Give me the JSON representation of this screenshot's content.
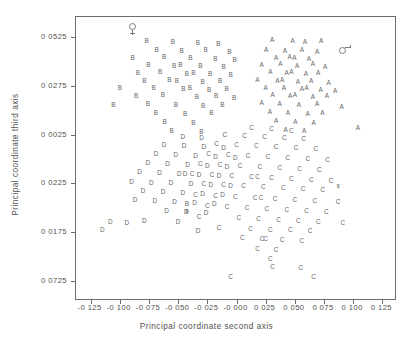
{
  "chart_data": {
    "type": "scatter",
    "title": "",
    "xlabel": "Principal coordinate second axis",
    "ylabel": "Principal coordinate third axis",
    "xlim": [
      -0.1375,
      0.1375
    ],
    "ylim": [
      -0.0825,
      0.0625
    ],
    "grid": false,
    "legend": "none",
    "xticks": [
      "-0 125",
      "-0 100",
      "-0 075",
      "-0 050",
      "-0 025",
      "-0 000",
      "0 025",
      "0 050",
      "0 075",
      "0 100",
      "0 125"
    ],
    "xtickvalues": [
      -0.125,
      -0.1,
      -0.075,
      -0.05,
      -0.025,
      -0.0,
      0.025,
      0.05,
      0.075,
      0.1,
      0.125
    ],
    "yticks": [
      "0 0525",
      "0 0275",
      "0 0025",
      "0 0225",
      "0 0175",
      "0 0725"
    ],
    "ytickvalues": [
      0.0525,
      0.0275,
      0.0025,
      -0.0225,
      -0.0475,
      -0.0725
    ],
    "marker_labels": [
      "A",
      "B",
      "C",
      "D"
    ],
    "series": [
      {
        "name": "A",
        "marker": "A",
        "points": [
          [
            0.0305,
            0.051
          ],
          [
            0.048,
            0.0505
          ],
          [
            0.0585,
            0.0495
          ],
          [
            0.0725,
            0.05
          ],
          [
            0.0255,
            0.0455
          ],
          [
            0.0415,
            0.045
          ],
          [
            0.056,
            0.0455
          ],
          [
            0.069,
            0.0445
          ],
          [
            0.034,
            0.0415
          ],
          [
            0.0455,
            0.042
          ],
          [
            0.0495,
            0.0415
          ],
          [
            0.062,
            0.041
          ],
          [
            0.0215,
            0.038
          ],
          [
            0.0375,
            0.0385
          ],
          [
            0.052,
            0.0375
          ],
          [
            0.0655,
            0.0385
          ],
          [
            0.076,
            0.037
          ],
          [
            0.029,
            0.0345
          ],
          [
            0.043,
            0.034
          ],
          [
            0.047,
            0.0345
          ],
          [
            0.0595,
            0.0335
          ],
          [
            0.07,
            0.034
          ],
          [
            0.018,
            0.0305
          ],
          [
            0.035,
            0.03
          ],
          [
            0.039,
            0.0305
          ],
          [
            0.0525,
            0.0295
          ],
          [
            0.064,
            0.03
          ],
          [
            0.079,
            0.029
          ],
          [
            0.025,
            0.0265
          ],
          [
            0.0405,
            0.026
          ],
          [
            0.056,
            0.0255
          ],
          [
            0.06,
            0.026
          ],
          [
            0.072,
            0.025
          ],
          [
            0.0845,
            0.0245
          ],
          [
            0.031,
            0.0225
          ],
          [
            0.046,
            0.022
          ],
          [
            0.05,
            0.0225
          ],
          [
            0.0655,
            0.0215
          ],
          [
            0.0775,
            0.022
          ],
          [
            0.0215,
            0.0185
          ],
          [
            0.037,
            0.018
          ],
          [
            0.0535,
            0.0175
          ],
          [
            0.069,
            0.018
          ],
          [
            0.09,
            0.0165
          ],
          [
            0.0285,
            0.014
          ],
          [
            0.044,
            0.0135
          ],
          [
            0.061,
            0.013
          ],
          [
            0.0735,
            0.0135
          ],
          [
            0.034,
            0.0095
          ],
          [
            0.0505,
            0.009
          ],
          [
            0.066,
            0.0085
          ],
          [
            0.042,
            0.005
          ],
          [
            0.058,
            0.0045
          ],
          [
            0.104,
            0.006
          ]
        ]
      },
      {
        "name": "B",
        "marker": "B",
        "points": [
          [
            -0.077,
            0.05
          ],
          [
            -0.0545,
            0.0495
          ],
          [
            -0.033,
            0.049
          ],
          [
            -0.0155,
            0.0485
          ],
          [
            -0.0685,
            0.0455
          ],
          [
            -0.047,
            0.045
          ],
          [
            -0.0265,
            0.0455
          ],
          [
            -0.006,
            0.0445
          ],
          [
            -0.089,
            0.0415
          ],
          [
            -0.062,
            0.042
          ],
          [
            -0.0395,
            0.0415
          ],
          [
            -0.018,
            0.041
          ],
          [
            -0.0015,
            0.0405
          ],
          [
            -0.0755,
            0.038
          ],
          [
            -0.0535,
            0.0375
          ],
          [
            -0.048,
            0.038
          ],
          [
            -0.031,
            0.0375
          ],
          [
            -0.011,
            0.037
          ],
          [
            -0.0845,
            0.034
          ],
          [
            -0.0655,
            0.0345
          ],
          [
            -0.0425,
            0.0335
          ],
          [
            -0.037,
            0.034
          ],
          [
            -0.0225,
            0.0335
          ],
          [
            -0.005,
            0.033
          ],
          [
            -0.079,
            0.03
          ],
          [
            -0.0575,
            0.0305
          ],
          [
            -0.051,
            0.03
          ],
          [
            -0.029,
            0.0295
          ],
          [
            -0.014,
            0.03
          ],
          [
            -0.1,
            0.0265
          ],
          [
            -0.071,
            0.026
          ],
          [
            -0.0455,
            0.0255
          ],
          [
            -0.04,
            0.026
          ],
          [
            -0.0235,
            0.025
          ],
          [
            -0.0085,
            0.0255
          ],
          [
            -0.086,
            0.022
          ],
          [
            -0.063,
            0.0225
          ],
          [
            -0.034,
            0.0215
          ],
          [
            -0.0175,
            0.022
          ],
          [
            -0.002,
            0.021
          ],
          [
            -0.1055,
            0.0175
          ],
          [
            -0.076,
            0.018
          ],
          [
            -0.052,
            0.0175
          ],
          [
            -0.0285,
            0.017
          ],
          [
            -0.012,
            0.0175
          ],
          [
            -0.069,
            0.0135
          ],
          [
            -0.044,
            0.013
          ],
          [
            -0.0215,
            0.0135
          ],
          [
            -0.0615,
            0.009
          ],
          [
            -0.037,
            0.0085
          ],
          [
            -0.0555,
            0.0045
          ],
          [
            -0.03,
            0.004
          ],
          [
            -0.0425,
            -0.033
          ]
        ]
      },
      {
        "name": "C",
        "marker": "C",
        "points": [
          [
            0.013,
            0.006
          ],
          [
            0.03,
            0.0055
          ],
          [
            0.047,
            0.0045
          ],
          [
            -0.01,
            0.002
          ],
          [
            0.007,
            0.0015
          ],
          [
            0.024,
            0.001
          ],
          [
            0.041,
            0.0005
          ],
          [
            0.0575,
            0.0
          ],
          [
            -0.017,
            -0.0025
          ],
          [
            0.0,
            -0.003
          ],
          [
            0.017,
            -0.0035
          ],
          [
            0.034,
            -0.004
          ],
          [
            0.051,
            -0.0045
          ],
          [
            0.068,
            -0.005
          ],
          [
            -0.024,
            -0.0075
          ],
          [
            -0.007,
            -0.008
          ],
          [
            0.01,
            -0.0085
          ],
          [
            0.027,
            -0.009
          ],
          [
            0.044,
            -0.0095
          ],
          [
            0.061,
            -0.01
          ],
          [
            0.078,
            -0.0105
          ],
          [
            -0.031,
            -0.0125
          ],
          [
            -0.014,
            -0.013
          ],
          [
            0.003,
            -0.0135
          ],
          [
            0.02,
            -0.014
          ],
          [
            0.037,
            -0.0145
          ],
          [
            0.054,
            -0.015
          ],
          [
            0.071,
            -0.0155
          ],
          [
            -0.038,
            -0.0175
          ],
          [
            -0.021,
            -0.018
          ],
          [
            -0.004,
            -0.0185
          ],
          [
            0.013,
            -0.019
          ],
          [
            0.018,
            -0.019
          ],
          [
            0.03,
            -0.0195
          ],
          [
            0.047,
            -0.02
          ],
          [
            0.064,
            -0.0205
          ],
          [
            0.081,
            -0.021
          ],
          [
            -0.028,
            -0.023
          ],
          [
            -0.011,
            -0.0235
          ],
          [
            0.006,
            -0.024
          ],
          [
            0.023,
            -0.0245
          ],
          [
            0.04,
            -0.025
          ],
          [
            0.057,
            -0.0255
          ],
          [
            0.074,
            -0.026
          ],
          [
            -0.035,
            -0.0285
          ],
          [
            -0.018,
            -0.029
          ],
          [
            -0.001,
            -0.0295
          ],
          [
            0.016,
            -0.03
          ],
          [
            0.021,
            -0.03
          ],
          [
            0.033,
            -0.0305
          ],
          [
            0.05,
            -0.031
          ],
          [
            0.067,
            -0.0315
          ],
          [
            0.087,
            -0.032
          ],
          [
            -0.025,
            -0.034
          ],
          [
            -0.008,
            -0.0345
          ],
          [
            0.009,
            -0.035
          ],
          [
            0.026,
            -0.0355
          ],
          [
            0.043,
            -0.036
          ],
          [
            0.06,
            -0.0365
          ],
          [
            0.077,
            -0.037
          ],
          [
            -0.032,
            -0.0395
          ],
          [
            0.002,
            -0.04
          ],
          [
            0.019,
            -0.0405
          ],
          [
            0.036,
            -0.041
          ],
          [
            0.053,
            -0.0415
          ],
          [
            0.07,
            -0.042
          ],
          [
            0.091,
            -0.0425
          ],
          [
            -0.015,
            -0.045
          ],
          [
            0.012,
            -0.0455
          ],
          [
            0.029,
            -0.046
          ],
          [
            0.046,
            -0.0465
          ],
          [
            0.063,
            -0.047
          ],
          [
            0.005,
            -0.0505
          ],
          [
            0.022,
            -0.051
          ],
          [
            0.025,
            -0.051
          ],
          [
            0.039,
            -0.0515
          ],
          [
            0.056,
            -0.052
          ],
          [
            0.018,
            -0.056
          ],
          [
            0.034,
            -0.0565
          ],
          [
            0.029,
            -0.061
          ],
          [
            0.031,
            -0.065
          ],
          [
            0.055,
            -0.0655
          ],
          [
            -0.005,
            -0.07
          ],
          [
            0.066,
            -0.07
          ]
        ]
      },
      {
        "name": "D",
        "marker": "D",
        "points": [
          [
            -0.046,
            0.001
          ],
          [
            -0.03,
            0.0005
          ],
          [
            -0.062,
            -0.003
          ],
          [
            -0.045,
            -0.0035
          ],
          [
            -0.028,
            -0.004
          ],
          [
            -0.011,
            -0.0045
          ],
          [
            -0.069,
            -0.0075
          ],
          [
            -0.052,
            -0.008
          ],
          [
            -0.035,
            -0.0085
          ],
          [
            -0.018,
            -0.009
          ],
          [
            -0.001,
            -0.0095
          ],
          [
            -0.076,
            -0.012
          ],
          [
            -0.059,
            -0.0125
          ],
          [
            -0.042,
            -0.013
          ],
          [
            -0.025,
            -0.0135
          ],
          [
            -0.008,
            -0.014
          ],
          [
            -0.083,
            -0.0165
          ],
          [
            -0.066,
            -0.017
          ],
          [
            -0.049,
            -0.0175
          ],
          [
            -0.044,
            -0.0175
          ],
          [
            -0.032,
            -0.018
          ],
          [
            -0.015,
            -0.0185
          ],
          [
            -0.09,
            -0.0215
          ],
          [
            -0.073,
            -0.022
          ],
          [
            -0.056,
            -0.0225
          ],
          [
            -0.039,
            -0.023
          ],
          [
            -0.022,
            -0.0235
          ],
          [
            -0.005,
            -0.024
          ],
          [
            -0.08,
            -0.0265
          ],
          [
            -0.063,
            -0.027
          ],
          [
            -0.046,
            -0.0275
          ],
          [
            -0.029,
            -0.028
          ],
          [
            -0.012,
            -0.0285
          ],
          [
            -0.087,
            -0.031
          ],
          [
            -0.07,
            -0.0315
          ],
          [
            -0.053,
            -0.032
          ],
          [
            -0.036,
            -0.0325
          ],
          [
            -0.019,
            -0.033
          ],
          [
            -0.06,
            -0.0365
          ],
          [
            -0.043,
            -0.037
          ],
          [
            -0.026,
            -0.0375
          ],
          [
            -0.108,
            -0.042
          ],
          [
            -0.094,
            -0.0425
          ],
          [
            -0.079,
            -0.0415
          ],
          [
            -0.05,
            -0.042
          ],
          [
            -0.115,
            -0.046
          ],
          [
            -0.033,
            -0.047
          ]
        ]
      }
    ],
    "special_points": [
      {
        "label": "ring-stem-marker",
        "marker": "ring-stem",
        "x": -0.0895,
        "y": 0.0575
      },
      {
        "label": "ring-tail-marker",
        "marker": "ring-tail",
        "x": 0.0905,
        "y": 0.0455
      },
      {
        "label": "bold-marker-right",
        "marker": "bold",
        "x": 0.087,
        "y": -0.024
      },
      {
        "label": "bold-marker-lower-left",
        "marker": "bold",
        "x": -0.0425,
        "y": -0.0365
      }
    ]
  }
}
